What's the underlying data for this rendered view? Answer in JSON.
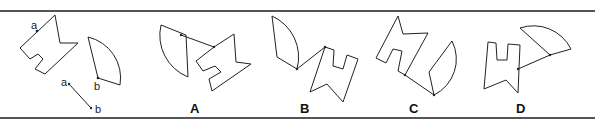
{
  "question": {
    "given_labels": {
      "point_a": "a",
      "point_b": "b",
      "arrow_start": "a",
      "arrow_end": "b"
    }
  },
  "options": [
    {
      "label": "A"
    },
    {
      "label": "B"
    },
    {
      "label": "C"
    },
    {
      "label": "D"
    }
  ],
  "colors": {
    "stroke": "#222222",
    "rule": "#555555",
    "background": "#ffffff"
  }
}
